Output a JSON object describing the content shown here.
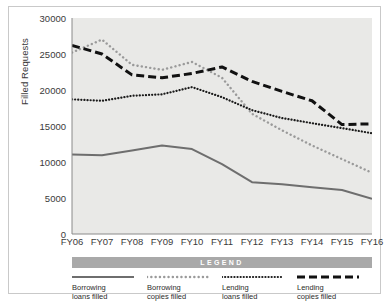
{
  "chart_data": {
    "type": "line",
    "title": "",
    "xlabel": "",
    "ylabel": "Filled Requests",
    "categories": [
      "FY06",
      "FY07",
      "FY08",
      "FY09",
      "FY10",
      "FY11",
      "FY12",
      "FY13",
      "FY14",
      "FY15",
      "FY16"
    ],
    "ylim": [
      0,
      30000
    ],
    "yticks": [
      0,
      5000,
      10000,
      15000,
      20000,
      25000,
      30000
    ],
    "ytick_labels": [
      "0",
      "5000",
      "10000",
      "15000",
      "20000",
      "25000",
      "30000"
    ],
    "grid": false,
    "legend_position": "bottom",
    "legend_title": "LEGEND",
    "series": [
      {
        "name": "Borrowing loans filled",
        "label_line1": "Borrowing",
        "label_line2": "loans filled",
        "style": "solid",
        "color": "#6e6e6e",
        "values": [
          11050,
          10950,
          11600,
          12300,
          11800,
          9700,
          7200,
          6900,
          6500,
          6100,
          4900
        ]
      },
      {
        "name": "Borrowing copies filled",
        "label_line1": "Borrowing",
        "label_line2": "copies filled",
        "style": "dotted-square-gray",
        "color": "#9a9a9a",
        "values": [
          25200,
          27000,
          23500,
          22800,
          23900,
          21700,
          16700,
          14400,
          12300,
          10400,
          8500
        ]
      },
      {
        "name": "Lending loans filled",
        "label_line1": "Lending",
        "label_line2": "loans filled",
        "style": "dotted-black",
        "color": "#1a1a1a",
        "values": [
          18700,
          18500,
          19200,
          19400,
          20400,
          19000,
          17200,
          16100,
          15400,
          14700,
          14000
        ]
      },
      {
        "name": "Lending copies filled",
        "label_line1": "Lending",
        "label_line2": "copies filled",
        "style": "dashed-black",
        "color": "#111111",
        "values": [
          26200,
          25000,
          22100,
          21700,
          22300,
          23200,
          21200,
          19800,
          18500,
          15200,
          15300
        ]
      }
    ]
  },
  "colors": {
    "plot_background": "#e9e9e7",
    "page_background": "#ffffff",
    "frame_border": "#c9c9c9",
    "axis": "#8a8a8a",
    "legend_bar": "#a9a9a9",
    "tick_text": "#3a3a3a"
  }
}
